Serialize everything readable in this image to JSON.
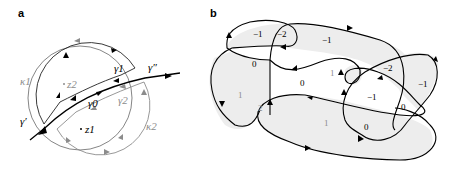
{
  "panel_a": {
    "label": "a",
    "labels": {
      "kappa1": "κ1",
      "kappa2": "κ2",
      "gamma0": "γ0",
      "gamma1": "γ1",
      "gamma2": "γ2",
      "gamma_prime": "γ′",
      "gamma_dprime": "γ″",
      "z1": "z1",
      "z2": "z2"
    },
    "colors": {
      "black": "#000000",
      "gray": "#8c8c8c"
    }
  },
  "panel_b": {
    "label": "b",
    "region_numbers": [
      {
        "id": "r1",
        "text": "−1",
        "color": "#000000"
      },
      {
        "id": "r2",
        "text": "−2",
        "color": "#000000"
      },
      {
        "id": "r3",
        "text": "−1",
        "color": "#000000"
      },
      {
        "id": "r4",
        "text": "0",
        "color": "#000000"
      },
      {
        "id": "r5",
        "text": "1",
        "color": "#8c8c8c"
      },
      {
        "id": "r6",
        "text": "0",
        "color": "#000000"
      },
      {
        "id": "r7",
        "text": "1",
        "color": "#8c8c8c"
      },
      {
        "id": "r8",
        "text": "−2",
        "color": "#000000"
      },
      {
        "id": "r9",
        "text": "−1",
        "color": "#000000"
      },
      {
        "id": "r10",
        "text": "−1",
        "color": "#000000"
      },
      {
        "id": "r11",
        "text": "0",
        "color": "#000000"
      },
      {
        "id": "r12",
        "text": "2",
        "color": "#8c8c8c"
      },
      {
        "id": "r13",
        "text": "1",
        "color": "#8c8c8c"
      },
      {
        "id": "r14",
        "text": "0",
        "color": "#000000"
      }
    ],
    "colors": {
      "shade": "#ededed",
      "stroke": "#000000"
    }
  }
}
